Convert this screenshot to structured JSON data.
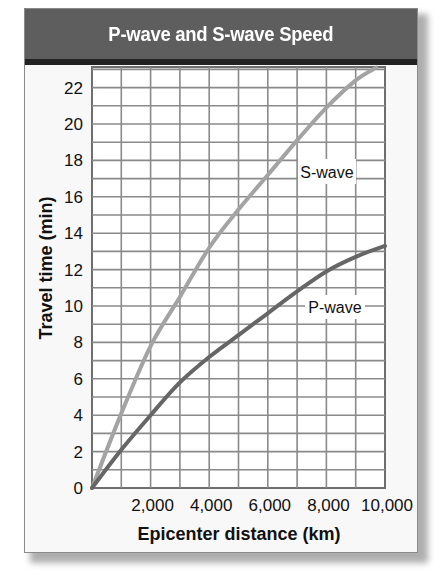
{
  "header": {
    "title": "P-wave and S-wave Speed"
  },
  "chart_data": {
    "type": "line",
    "title": "P-wave and S-wave Speed",
    "xlabel": "Epicenter distance (km)",
    "ylabel": "Travel time (min)",
    "xlim": [
      0,
      10000
    ],
    "ylim": [
      0,
      23
    ],
    "grid": true,
    "x_ticks": [
      "2,000",
      "4,000",
      "6,000",
      "8,000",
      "10,000"
    ],
    "y_ticks": [
      "0",
      "2",
      "4",
      "6",
      "8",
      "10",
      "12",
      "14",
      "16",
      "18",
      "20",
      "22"
    ],
    "x": [
      0,
      1000,
      2000,
      3000,
      4000,
      5000,
      6000,
      7000,
      8000,
      9000,
      10000
    ],
    "series": [
      {
        "name": "S-wave",
        "color": "#a3a3a3",
        "values": [
          0,
          4.1,
          7.8,
          10.5,
          13.2,
          15.3,
          17.2,
          19.1,
          20.9,
          22.4,
          null
        ],
        "end_point": [
          9700,
          23.1
        ]
      },
      {
        "name": "P-wave",
        "color": "#666666",
        "values": [
          0,
          2.1,
          4.0,
          5.8,
          7.2,
          8.4,
          9.6,
          10.8,
          11.9,
          12.7,
          13.3
        ]
      }
    ],
    "legend_position": "inline labels on curves"
  }
}
